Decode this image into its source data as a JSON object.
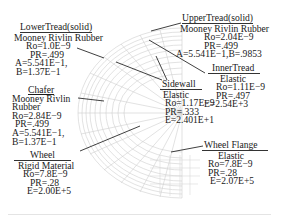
{
  "figure": {
    "mesh": {
      "name": "tire-cross-section-mesh",
      "stroke": "#c8c8c8"
    },
    "leader_color": "#2a2a2a"
  },
  "labels": {
    "lower_tread": {
      "title": "LowerTread(solid)",
      "lines": [
        "Mooney Rivlin Rubber",
        "Ro=1.0E−9",
        "PR=.499",
        "A=5.541E−1,",
        "B=1.37E−1"
      ]
    },
    "upper_tread": {
      "title": "UpperTread(solid)",
      "lines": [
        "Mooney Rivlin Rubber",
        "Ro=2.04E−9",
        "PR=.499",
        "A=5.541E−1,B=.9853"
      ]
    },
    "inner_tread": {
      "title": "InnerTread",
      "lines": [
        "Elastic",
        "Ro=1.11E−9",
        "PR=.497",
        "E=2.54E+3"
      ]
    },
    "sidewall": {
      "title": "Sidewall",
      "lines": [
        "Elastic",
        "Ro=1.17E−9",
        "PR=.333",
        "E=2.401E+1"
      ]
    },
    "chafer": {
      "title": "Chafer",
      "lines": [
        "Mooney Rivlin",
        "Rubber",
        "Ro=2.84E−9",
        "PR=.499",
        "A=5.541E−1,",
        "B=1.37E−1"
      ]
    },
    "wheel": {
      "title": "Wheel",
      "lines": [
        "Rigid Material",
        "Ro=7.8E−9",
        "PR=.28",
        "E=2.00E+5"
      ]
    },
    "wheel_flange": {
      "title": "Wheel Flange",
      "lines": [
        "Elastic",
        "Ro=7.8E−9",
        "PR=.28",
        "E=2.07E+5"
      ]
    }
  }
}
